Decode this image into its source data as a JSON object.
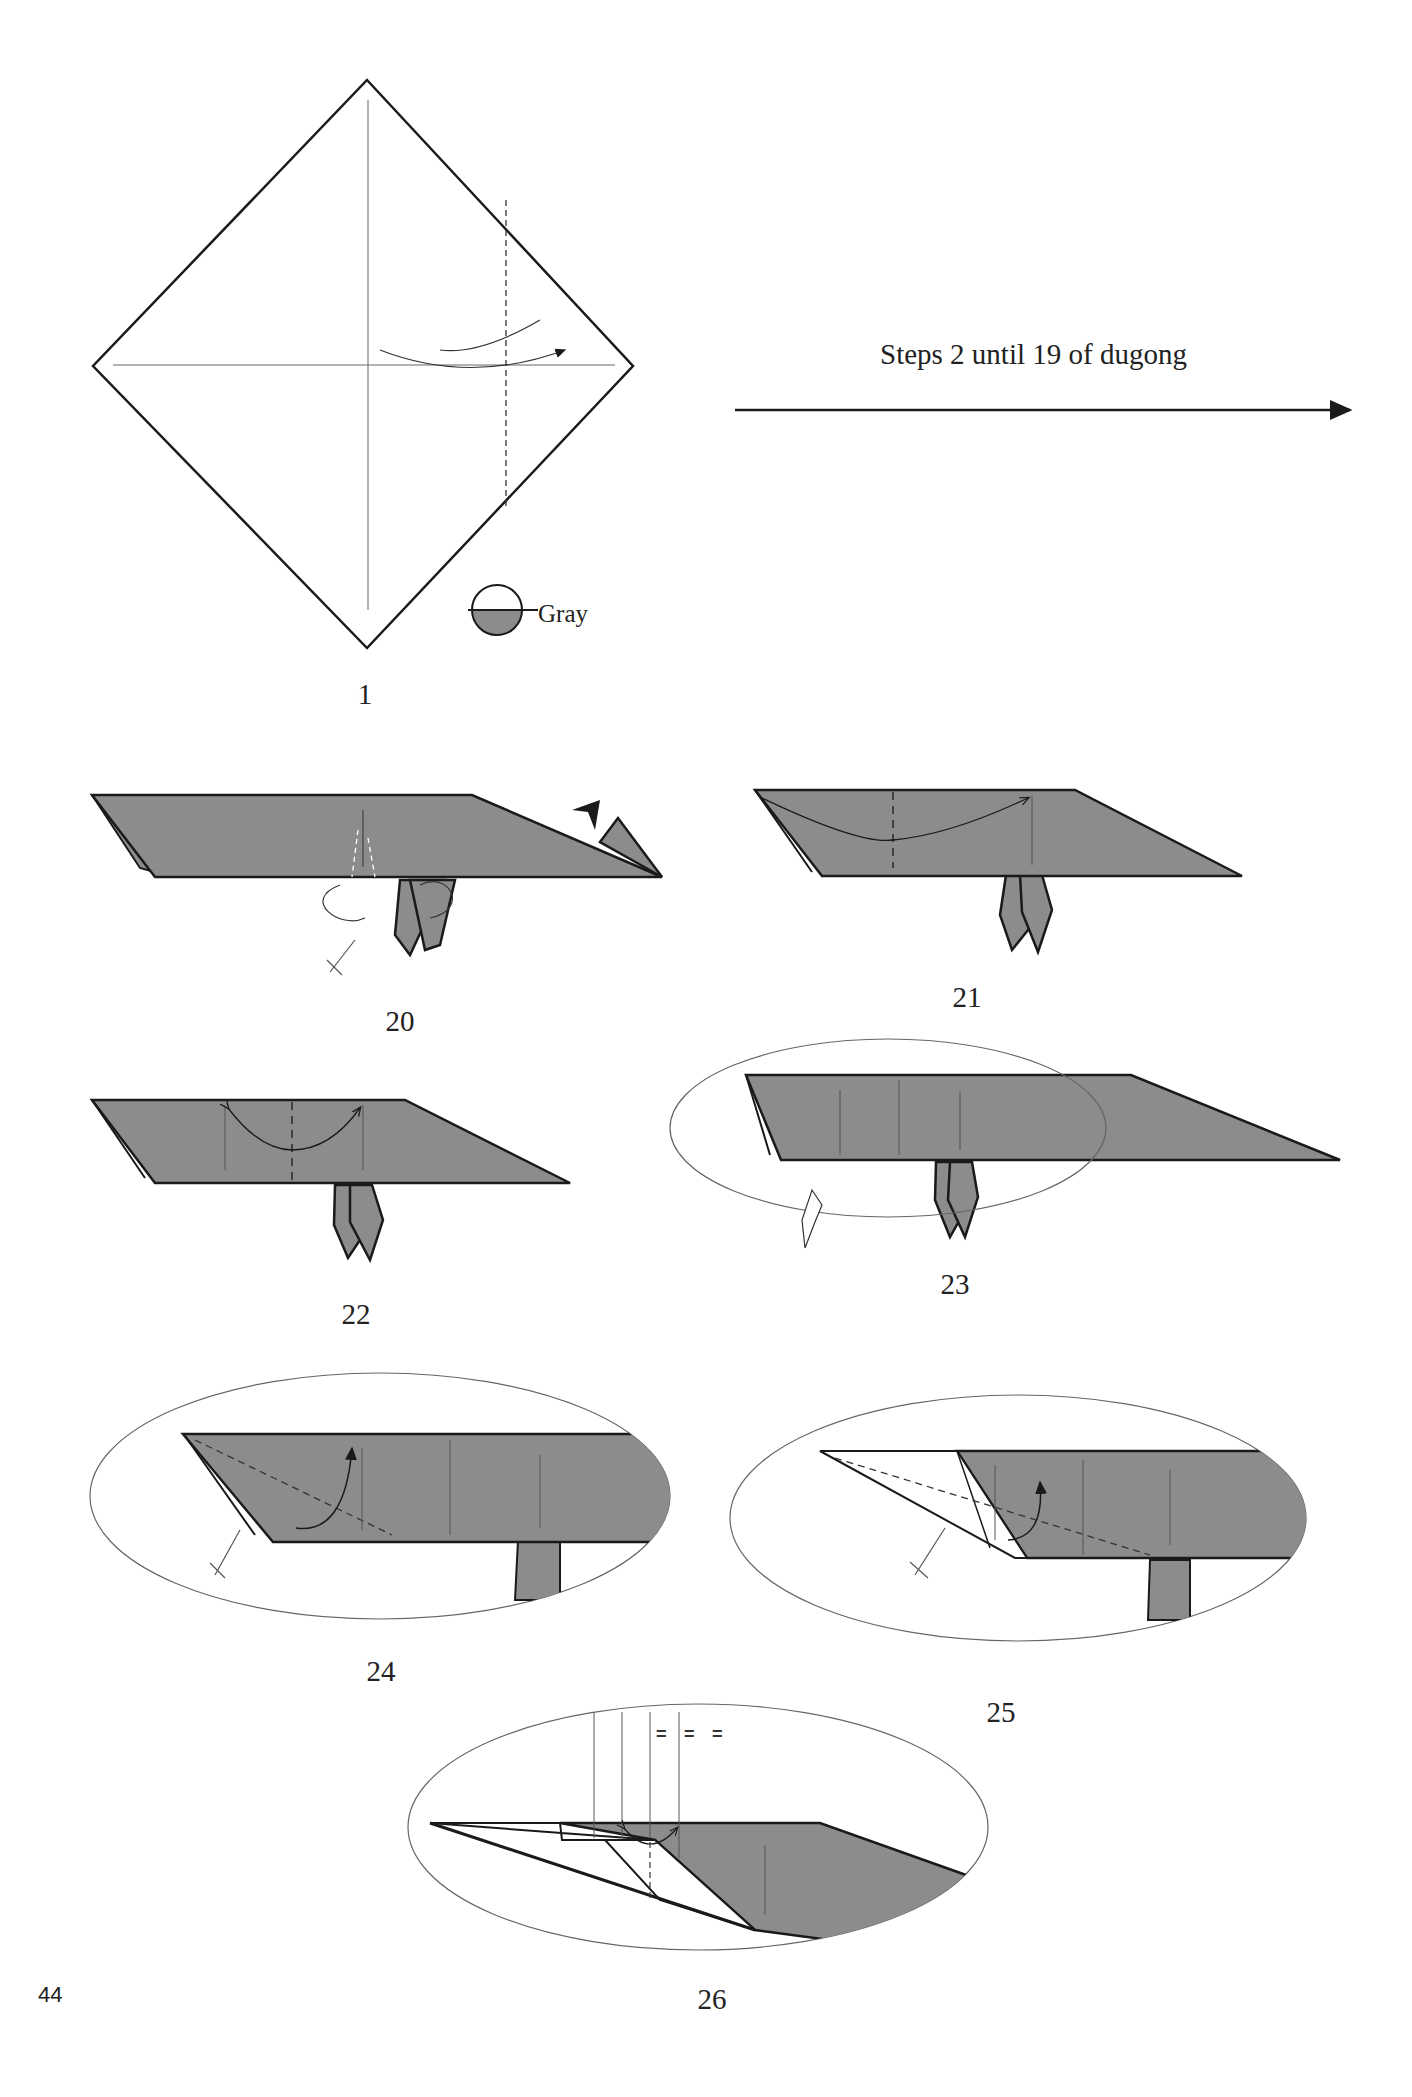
{
  "page": {
    "page_number": "44",
    "instruction_text": "Steps 2 until 19 of dugong",
    "paper_color_legend": {
      "label": "Gray",
      "color": "#8c8c8c"
    }
  },
  "steps": [
    {
      "number": "1",
      "description": "Square diamond with center creases, valley fold dashed line on right, curved arrow; color legend Gray"
    },
    {
      "number": "20",
      "description": "Gray body with flipper folds, sink arrow at right, push arrow at flippers"
    },
    {
      "number": "21",
      "description": "Valley fold dashed line with curved arrow to the right crease"
    },
    {
      "number": "22",
      "description": "Valley fold dashed line at center with double-sided arrow, two crease lines"
    },
    {
      "number": "23",
      "description": "Zoom circle around left end, turn-over arrow"
    },
    {
      "number": "24",
      "description": "Zoomed view: diagonal dashed valley fold with curved arrow, push arrow"
    },
    {
      "number": "25",
      "description": "Zoomed view: white reverse fold layer, diagonal dashed line with curved arrow"
    },
    {
      "number": "26",
      "description": "Zoomed view: three equal divisions marked with = = ="
    }
  ],
  "equal_marks": [
    "=",
    "=",
    "="
  ],
  "colors": {
    "paper_gray": "#8c8c8c",
    "line": "#1a1a1a",
    "thin_line": "#555555"
  }
}
